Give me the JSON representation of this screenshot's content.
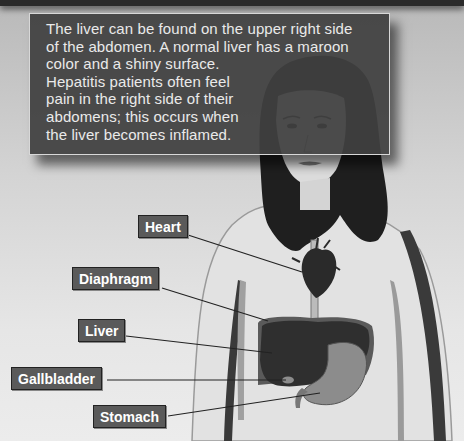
{
  "info_box": {
    "text": "The liver can be found on the upper right side\nof the abdomen. A normal liver has a maroon\ncolor and a shiny surface.\nHepatitis patients often feel\npain in the right side of their\nabdomens; this occurs when\nthe liver becomes inflamed."
  },
  "labels": {
    "heart": "Heart",
    "diaphragm": "Diaphragm",
    "liver": "Liver",
    "gallbladder": "Gallbladder",
    "stomach": "Stomach"
  },
  "colors": {
    "label_bg": "#5a5a5a",
    "box_bg": "#404040",
    "organ_dark": "#2e2e2e",
    "stomach": "#8a8a8a"
  }
}
